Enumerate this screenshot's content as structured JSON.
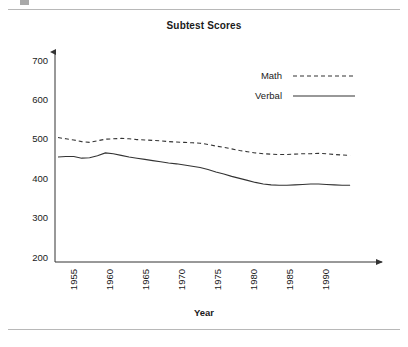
{
  "page": {
    "top_rule": "horizontal-rule",
    "bottom_rule": "horizontal-rule",
    "corner_mark": "cropped-figure-mark"
  },
  "chart_data": {
    "type": "line",
    "title": "Subtest Scores",
    "xlabel": "Year",
    "ylabel": "",
    "xlim": [
      1952,
      1990
    ],
    "ylim": [
      200,
      700
    ],
    "grid": false,
    "legend_position": "top-right",
    "xticks": [
      "1955",
      "1960",
      "1965",
      "1970",
      "1975",
      "1980",
      "1985",
      "1990"
    ],
    "xtick_values": [
      1955,
      1960,
      1965,
      1970,
      1975,
      1980,
      1985,
      1990
    ],
    "yticks": [
      "200",
      "300",
      "400",
      "500",
      "600",
      "700"
    ],
    "ytick_values": [
      200,
      300,
      400,
      500,
      600,
      700
    ],
    "x": [
      1952,
      1953,
      1954,
      1955,
      1956,
      1957,
      1958,
      1959,
      1960,
      1961,
      1962,
      1963,
      1964,
      1965,
      1966,
      1967,
      1968,
      1969,
      1970,
      1971,
      1972,
      1973,
      1974,
      1975,
      1976,
      1977,
      1978,
      1979,
      1980,
      1981,
      1982,
      1983,
      1984,
      1985,
      1986,
      1987,
      1988,
      1989
    ],
    "series": [
      {
        "name": "Math",
        "style": "dashed",
        "color": "#333333",
        "values": [
          508,
          505,
          502,
          498,
          496,
          500,
          504,
          505,
          506,
          505,
          503,
          502,
          501,
          500,
          498,
          497,
          496,
          495,
          494,
          491,
          487,
          484,
          480,
          476,
          473,
          470,
          468,
          467,
          466,
          466,
          467,
          468,
          468,
          469,
          468,
          466,
          465,
          464
        ]
      },
      {
        "name": "Verbal",
        "style": "solid",
        "color": "#333333",
        "values": [
          460,
          461,
          461,
          457,
          458,
          463,
          470,
          468,
          464,
          460,
          457,
          454,
          451,
          448,
          445,
          443,
          440,
          437,
          434,
          429,
          423,
          418,
          412,
          407,
          402,
          397,
          393,
          391,
          390,
          390,
          391,
          392,
          393,
          393,
          392,
          391,
          390,
          390
        ]
      }
    ]
  }
}
